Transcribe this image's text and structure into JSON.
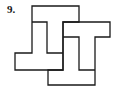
{
  "figure": {
    "number_label": "9.",
    "stroke_color": "#1a1a1a",
    "background_color": "#ffffff"
  }
}
